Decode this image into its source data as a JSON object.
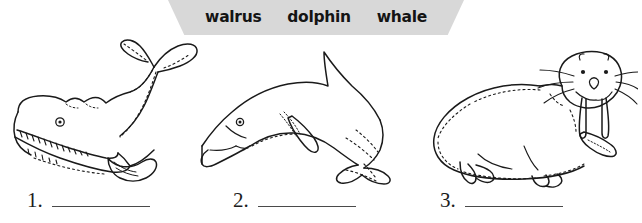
{
  "word_bank": {
    "name": "word-bank-banner",
    "background_color": "#d8d8d8",
    "words": [
      {
        "label": "walrus"
      },
      {
        "label": "dolphin"
      },
      {
        "label": "whale"
      }
    ]
  },
  "illustrations": [
    {
      "animal": "whale",
      "icon": "whale-line-drawing",
      "description": "black-and-white outline drawing of a whale with open toothy mouth and raised tail flukes"
    },
    {
      "animal": "dolphin",
      "icon": "dolphin-line-drawing",
      "description": "black-and-white outline drawing of a leaping dolphin with dorsal fin and tail flukes"
    },
    {
      "animal": "walrus",
      "icon": "walrus-line-drawing",
      "description": "black-and-white outline drawing of a walrus with tusks, whiskers and flippers"
    }
  ],
  "answers": {
    "items": [
      {
        "number": "1.",
        "value": ""
      },
      {
        "number": "2.",
        "value": ""
      },
      {
        "number": "3.",
        "value": ""
      }
    ]
  },
  "colors": {
    "page_background": "#ffffff",
    "ink": "#111111",
    "rule_line": "#4a4a4a"
  }
}
